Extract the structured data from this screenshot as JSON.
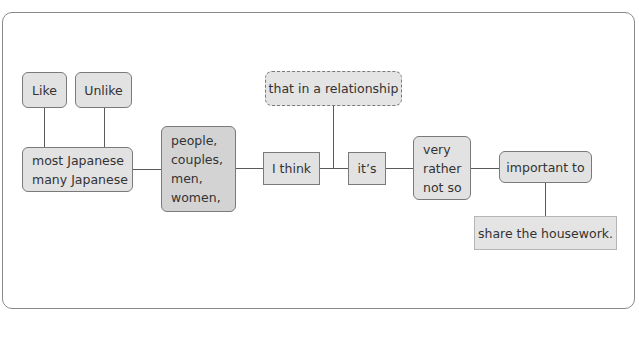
{
  "diagram": {
    "type": "sentence-building flowchart",
    "nodes": {
      "like": {
        "label": "Like"
      },
      "unlike": {
        "label": "Unlike"
      },
      "subject": {
        "lines": [
          "most Japanese",
          "many Japanese"
        ]
      },
      "group": {
        "lines": [
          "people,",
          "couples,",
          "men,",
          "women,"
        ]
      },
      "relationship": {
        "label": "that in a relationship",
        "style": "dashed",
        "optional": true
      },
      "i_think": {
        "label": "I think"
      },
      "its": {
        "label": "it’s"
      },
      "degree": {
        "lines": [
          "very",
          "rather",
          "not so"
        ]
      },
      "important": {
        "label": "important to"
      },
      "share": {
        "label": "share the housework."
      }
    },
    "edges": [
      [
        "like",
        "subject"
      ],
      [
        "unlike",
        "subject"
      ],
      [
        "subject",
        "group"
      ],
      [
        "group",
        "i_think"
      ],
      [
        "i_think",
        "its"
      ],
      [
        "relationship",
        "i_think-its"
      ],
      [
        "its",
        "degree"
      ],
      [
        "degree",
        "important"
      ],
      [
        "important",
        "share"
      ]
    ],
    "colors": {
      "node_fill": "#e2e2e2",
      "node_fill_dark": "#d3d3d3",
      "node_border": "#7a7a7a",
      "frame_border": "#8a8a8a",
      "line": "#5a5a5a"
    }
  }
}
